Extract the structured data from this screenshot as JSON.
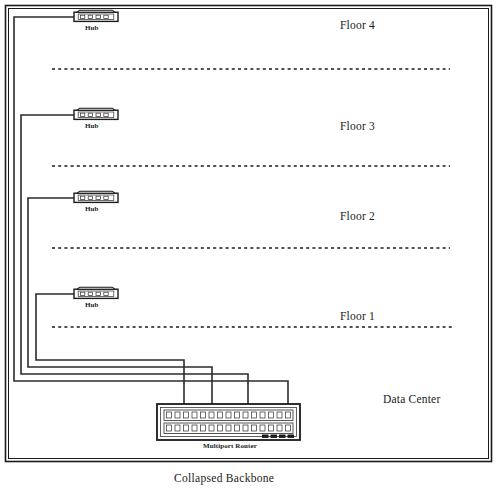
{
  "diagram": {
    "title": "Collapsed Backbone",
    "caption": "Collapsed Backbone",
    "frame_color": "#1a1a1a",
    "cable_color": "#2b2b2b",
    "background": "#ffffff",
    "floors": [
      {
        "id": "floor-4",
        "label": "Floor 4",
        "label_x": 340,
        "label_y": 20,
        "hub_x": 74,
        "hub_y": 10,
        "cable_drop_x": 8,
        "router_entry_x": 32
      },
      {
        "id": "floor-3",
        "label": "Floor 3",
        "label_x": 340,
        "label_y": 121,
        "hub_x": 74,
        "hub_y": 108,
        "cable_drop_x": 16,
        "router_entry_x": 212
      },
      {
        "id": "floor-2",
        "label": "Floor 2",
        "label_x": 340,
        "label_y": 211,
        "hub_x": 74,
        "hub_y": 191,
        "cable_drop_x": 25,
        "router_entry_x": 248
      },
      {
        "id": "floor-1",
        "label": "Floor 1",
        "label_x": 340,
        "label_y": 311,
        "hub_x": 74,
        "hub_y": 287,
        "cable_drop_x": 36,
        "router_entry_x": 288
      }
    ],
    "dotted_lines": [
      {
        "id": "floor-4-run",
        "y": 69,
        "x1": 52,
        "x2": 450
      },
      {
        "id": "floor-3-run",
        "y": 166,
        "x1": 52,
        "x2": 450
      },
      {
        "id": "floor-2-run",
        "y": 248,
        "x1": 52,
        "x2": 450
      },
      {
        "id": "floor-1-run",
        "y": 327,
        "x1": 52,
        "x2": 452
      }
    ],
    "hub": {
      "label": "Hub",
      "port_count": 4,
      "width": 44,
      "height": 12
    },
    "router": {
      "label": "Multiport Router",
      "x": 157,
      "y": 404,
      "width": 143,
      "height": 36,
      "top_port_count": 15,
      "bottom_port_count": 15,
      "led_count": 4
    },
    "zones": [
      {
        "id": "data-center",
        "label": "Data Center",
        "x": 383,
        "y": 394
      }
    ],
    "frame": {
      "outer_x": 5,
      "outer_y": 5,
      "outer_w": 487,
      "outer_h": 457
    }
  }
}
